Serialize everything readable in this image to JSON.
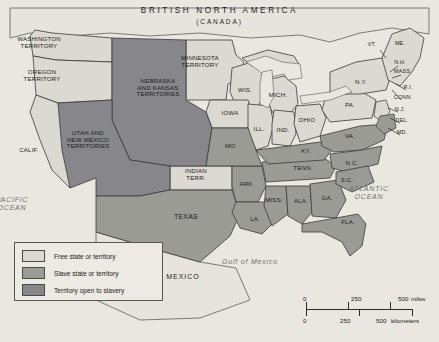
{
  "map": {
    "title": "BRITISH NORTH AMERICA",
    "subtitle": "(CANADA)",
    "colors": {
      "free": "#dbd9d1",
      "slave": "#9b9b96",
      "open": "#86868b",
      "water": "#e9e7e0",
      "background": "#f2f1ec",
      "border": "#3a3a3a",
      "text": "#1c1c1c",
      "ocean_text": "#6f6f70"
    },
    "oceans": [
      {
        "name": "pacific-ocean-label",
        "text": "PACIFIC\nOCEAN",
        "x": 12,
        "y": 204
      },
      {
        "name": "atlantic-ocean-label",
        "text": "ATLANTIC\nOCEAN",
        "x": 369,
        "y": 193
      },
      {
        "name": "gulf-of-mexico-label",
        "text": "Gulf of Mexico",
        "x": 250,
        "y": 262
      }
    ],
    "neighbors": [
      {
        "name": "mexico-label",
        "text": "MEXICO",
        "x": 183,
        "y": 277
      }
    ],
    "regions": [
      {
        "id": "washington-territory",
        "text": "WASHINGTON\nTERRITORY",
        "status": "free",
        "x": 39,
        "y": 43,
        "size": "sm"
      },
      {
        "id": "oregon-territory",
        "text": "OREGON\nTERRITORY",
        "status": "free",
        "x": 42,
        "y": 76,
        "size": "sm"
      },
      {
        "id": "california",
        "text": "CALIF.",
        "status": "free",
        "x": 29,
        "y": 150,
        "size": "sm"
      },
      {
        "id": "utah-and-new-mexico-territories",
        "text": "UTAH AND\nNEW MEXICO\nTERRITORIES",
        "status": "open",
        "x": 88,
        "y": 140,
        "size": "sm"
      },
      {
        "id": "nebraska-and-kansas-territories",
        "text": "NEBRASKA\nAND KANSAS\nTERRITORIES",
        "status": "open",
        "x": 158,
        "y": 88,
        "size": "sm"
      },
      {
        "id": "minnesota-territory",
        "text": "MINNESOTA\nTERRITORY",
        "status": "free",
        "x": 200,
        "y": 62,
        "size": "sm"
      },
      {
        "id": "wisconsin",
        "text": "WIS.",
        "status": "free",
        "x": 245,
        "y": 90,
        "size": "sm"
      },
      {
        "id": "michigan",
        "text": "MICH.",
        "status": "free",
        "x": 278,
        "y": 95,
        "size": "sm"
      },
      {
        "id": "iowa",
        "text": "IOWA",
        "status": "free",
        "x": 230,
        "y": 113,
        "size": "sm"
      },
      {
        "id": "illinois",
        "text": "ILL.",
        "status": "free",
        "x": 259,
        "y": 129,
        "size": "sm"
      },
      {
        "id": "indiana",
        "text": "IND.",
        "status": "free",
        "x": 283,
        "y": 130,
        "size": "sm"
      },
      {
        "id": "ohio",
        "text": "OHIO",
        "status": "free",
        "x": 307,
        "y": 120,
        "size": "sm"
      },
      {
        "id": "pennsylvania",
        "text": "PA.",
        "status": "free",
        "x": 350,
        "y": 105,
        "size": "sm"
      },
      {
        "id": "new-york",
        "text": "N.Y.",
        "status": "free",
        "x": 361,
        "y": 82,
        "size": "sm"
      },
      {
        "id": "vermont",
        "text": "VT.",
        "status": "free",
        "x": 372,
        "y": 45,
        "size": "tiny"
      },
      {
        "id": "maine",
        "text": "ME.",
        "status": "free",
        "x": 400,
        "y": 44,
        "size": "tiny"
      },
      {
        "id": "new-hampshire",
        "text": "N.H.",
        "status": "free",
        "x": 400,
        "y": 63,
        "size": "tiny"
      },
      {
        "id": "massachusetts",
        "text": "MASS.",
        "status": "free",
        "x": 403,
        "y": 72,
        "size": "tiny"
      },
      {
        "id": "rhode-island",
        "text": "R.I.",
        "status": "free",
        "x": 408,
        "y": 88,
        "size": "tiny"
      },
      {
        "id": "connecticut",
        "text": "CONN.",
        "status": "free",
        "x": 403,
        "y": 98,
        "size": "tiny"
      },
      {
        "id": "new-jersey",
        "text": "N.J.",
        "status": "free",
        "x": 400,
        "y": 110,
        "size": "tiny"
      },
      {
        "id": "delaware",
        "text": "DEL.",
        "status": "slave",
        "x": 402,
        "y": 121,
        "size": "tiny"
      },
      {
        "id": "maryland",
        "text": "MD.",
        "status": "slave",
        "x": 402,
        "y": 133,
        "size": "tiny"
      },
      {
        "id": "virginia",
        "text": "VA.",
        "status": "slave",
        "x": 350,
        "y": 136,
        "size": "sm"
      },
      {
        "id": "kentucky",
        "text": "KY.",
        "status": "slave",
        "x": 306,
        "y": 151,
        "size": "sm"
      },
      {
        "id": "missouri",
        "text": "MO.",
        "status": "slave",
        "x": 231,
        "y": 146,
        "size": "sm"
      },
      {
        "id": "tennessee",
        "text": "TENN.",
        "status": "slave",
        "x": 303,
        "y": 168,
        "size": "sm"
      },
      {
        "id": "north-carolina",
        "text": "N.C.",
        "status": "slave",
        "x": 352,
        "y": 163,
        "size": "sm"
      },
      {
        "id": "south-carolina",
        "text": "S.C.",
        "status": "slave",
        "x": 347,
        "y": 180,
        "size": "sm"
      },
      {
        "id": "georgia",
        "text": "GA.",
        "status": "slave",
        "x": 327,
        "y": 198,
        "size": "sm"
      },
      {
        "id": "alabama",
        "text": "ALA.",
        "status": "slave",
        "x": 301,
        "y": 201,
        "size": "sm"
      },
      {
        "id": "mississippi",
        "text": "MISS.",
        "status": "slave",
        "x": 274,
        "y": 200,
        "size": "sm"
      },
      {
        "id": "arkansas",
        "text": "ARK.",
        "status": "slave",
        "x": 247,
        "y": 184,
        "size": "sm"
      },
      {
        "id": "louisiana",
        "text": "LA.",
        "status": "slave",
        "x": 255,
        "y": 219,
        "size": "sm"
      },
      {
        "id": "florida",
        "text": "FLA.",
        "status": "slave",
        "x": 348,
        "y": 222,
        "size": "sm"
      },
      {
        "id": "texas",
        "text": "TEXAS",
        "status": "slave",
        "x": 186,
        "y": 217,
        "size": "md"
      },
      {
        "id": "indian-territory",
        "text": "INDIAN\nTERR.",
        "status": "free",
        "x": 196,
        "y": 175,
        "size": "sm"
      }
    ],
    "legend": {
      "title": "legend",
      "items": [
        {
          "id": "free",
          "label": "Free state or territory",
          "color": "#dbd9d1"
        },
        {
          "id": "slave",
          "label": "Slave state or territory",
          "color": "#9b9b96"
        },
        {
          "id": "open",
          "label": "Territory open to slavery",
          "color": "#86868b"
        }
      ]
    },
    "scale": {
      "miles": {
        "ticks": [
          "0",
          "250",
          "500"
        ],
        "unit": "miles"
      },
      "kilometers": {
        "ticks": [
          "0",
          "250",
          "500"
        ],
        "unit": "kilometers"
      }
    }
  }
}
